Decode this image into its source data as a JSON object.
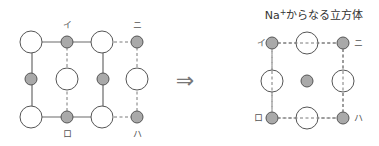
{
  "diagram": {
    "left_figure": {
      "labels": {
        "i": "イ",
        "ni": "ニ",
        "ro": "ロ",
        "ha": "ハ"
      },
      "legend": {
        "large_circle": "Cl-",
        "small_circle": "Na+"
      }
    },
    "arrow": "⇒",
    "right_figure": {
      "title_main": "Na",
      "title_sup": "+",
      "title_rest": "からなる立方体",
      "labels": {
        "i": "イ",
        "ni": "ニ",
        "ro": "ロ",
        "ha": "ハ"
      }
    },
    "colors": {
      "small_fill": "#a9a9a9",
      "outline": "#555555",
      "background": "#ffffff"
    }
  }
}
